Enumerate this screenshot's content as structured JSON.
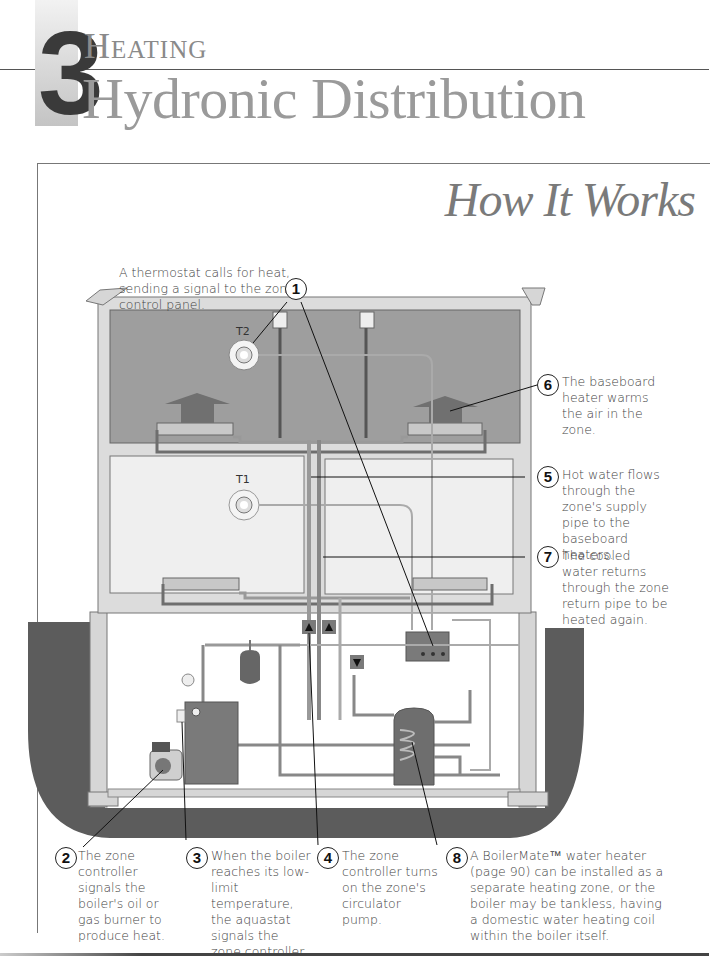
{
  "header": {
    "chapter_number": "3",
    "kicker": "Heating",
    "title": "Hydronic Distribution"
  },
  "section": {
    "title": "How It Works"
  },
  "diagram": {
    "labels": {
      "thermostat_upper": "T2",
      "thermostat_lower": "T1"
    },
    "colors": {
      "upper_zone": "#9e9e9e",
      "lower_zone": "#efefef",
      "wall": "#d6d6d6",
      "ground": "#5c5c5c",
      "pipe": "#888888",
      "equipment": "#7a7a7a"
    }
  },
  "callouts": [
    {
      "number": "1",
      "text": "A thermostat calls for heat, sending a signal to the zone control panel."
    },
    {
      "number": "2",
      "text": "The zone controller signals the boiler's oil or gas burner to produce heat."
    },
    {
      "number": "3",
      "text": "When the boiler reaches its low-limit temperature, the aquastat signals the zone controller."
    },
    {
      "number": "4",
      "text": "The zone controller turns on the zone's circulator pump."
    },
    {
      "number": "5",
      "text": "Hot water flows through the zone's supply pipe to the baseboard heaters."
    },
    {
      "number": "6",
      "text": "The baseboard heater warms the air in the zone."
    },
    {
      "number": "7",
      "text": "The cooled water returns through the zone return pipe to be heated again."
    },
    {
      "number": "8",
      "text": "A BoilerMate™ water heater (page 90) can be installed as a separate heating zone, or the boiler may be tankless, having a domestic water heating coil within the boiler itself."
    }
  ]
}
